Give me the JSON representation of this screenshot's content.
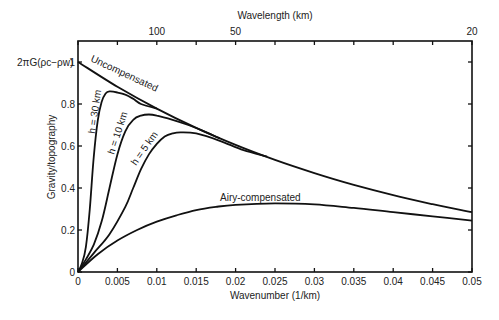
{
  "chart_data": {
    "type": "line",
    "title": "",
    "xlabel": "Wavenumber (1/km)",
    "ylabel": "Gravity/topography",
    "top_xlabel": "Wavelength (km)",
    "xlim": [
      0,
      0.05
    ],
    "ylim": [
      0,
      1.1
    ],
    "grid": false,
    "legend": "none (inline curve labels)",
    "x_ticks": [
      0,
      0.005,
      0.01,
      0.015,
      0.02,
      0.025,
      0.03,
      0.035,
      0.04,
      0.045,
      0.05
    ],
    "x_tick_labels": [
      "0",
      "0.005",
      "0.01",
      "0.015",
      "0.02",
      "0.025",
      "0.03",
      "0.035",
      "0.04",
      "0.045",
      "0.05"
    ],
    "y_ticks": [
      0,
      0.2,
      0.4,
      0.6,
      0.8,
      1
    ],
    "y_tick_labels": [
      "0",
      "0.2",
      "0.4",
      "0.6",
      "0.8",
      "1"
    ],
    "y_top_label": "2πG(ρc−ρw)",
    "top_ticks": [
      {
        "k": 0.01,
        "label": "100"
      },
      {
        "k": 0.02,
        "label": "50"
      },
      {
        "k": 0.05,
        "label": "20"
      }
    ],
    "series": [
      {
        "name": "Uncompensated",
        "label": "Uncompensated",
        "x": [
          0,
          0.005,
          0.01,
          0.015,
          0.02,
          0.025,
          0.03,
          0.035,
          0.04,
          0.045,
          0.05
        ],
        "y": [
          1.0,
          0.882,
          0.778,
          0.686,
          0.605,
          0.534,
          0.471,
          0.415,
          0.366,
          0.323,
          0.285
        ]
      },
      {
        "name": "h = 30 km",
        "label": "h = 30 km",
        "x": [
          0,
          0.0005,
          0.001,
          0.0015,
          0.002,
          0.0025,
          0.003,
          0.0035,
          0.004,
          0.005,
          0.006,
          0.007,
          0.008,
          0.01
        ],
        "y": [
          0,
          0.04,
          0.12,
          0.3,
          0.55,
          0.72,
          0.81,
          0.85,
          0.86,
          0.855,
          0.845,
          0.825,
          0.8,
          0.778
        ]
      },
      {
        "name": "h = 10 km",
        "label": "h = 10 km",
        "x": [
          0,
          0.001,
          0.002,
          0.003,
          0.004,
          0.005,
          0.006,
          0.007,
          0.008,
          0.009,
          0.01,
          0.012,
          0.014,
          0.016,
          0.018
        ],
        "y": [
          0,
          0.06,
          0.13,
          0.24,
          0.4,
          0.56,
          0.67,
          0.725,
          0.745,
          0.75,
          0.745,
          0.725,
          0.7,
          0.67,
          0.636
        ]
      },
      {
        "name": "h = 5 km",
        "label": "h = 5 km",
        "x": [
          0,
          0.002,
          0.004,
          0.006,
          0.007,
          0.008,
          0.009,
          0.01,
          0.011,
          0.012,
          0.013,
          0.015,
          0.018,
          0.021,
          0.024
        ],
        "y": [
          0,
          0.09,
          0.18,
          0.31,
          0.4,
          0.49,
          0.56,
          0.61,
          0.645,
          0.66,
          0.665,
          0.66,
          0.625,
          0.58,
          0.55
        ]
      },
      {
        "name": "Airy-compensated",
        "label": "Airy-compensated",
        "x": [
          0,
          0.0025,
          0.005,
          0.0075,
          0.01,
          0.0125,
          0.015,
          0.0175,
          0.02,
          0.025,
          0.03,
          0.035,
          0.04,
          0.045,
          0.05
        ],
        "y": [
          0,
          0.085,
          0.15,
          0.2,
          0.24,
          0.27,
          0.295,
          0.31,
          0.32,
          0.327,
          0.322,
          0.305,
          0.285,
          0.265,
          0.245
        ]
      }
    ]
  }
}
